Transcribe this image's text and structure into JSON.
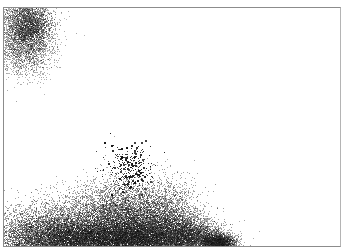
{
  "app": {
    "canvas_label": "Drawing canvas",
    "tool": "airbrush",
    "ink_color": "#000000",
    "background_color": "#ffffff"
  },
  "strokes": [
    {
      "name": "spray-blob-top-left",
      "density": "dense"
    },
    {
      "name": "spray-mound-bottom",
      "density": "dense"
    },
    {
      "name": "spray-speckle-center",
      "density": "sparse"
    }
  ]
}
